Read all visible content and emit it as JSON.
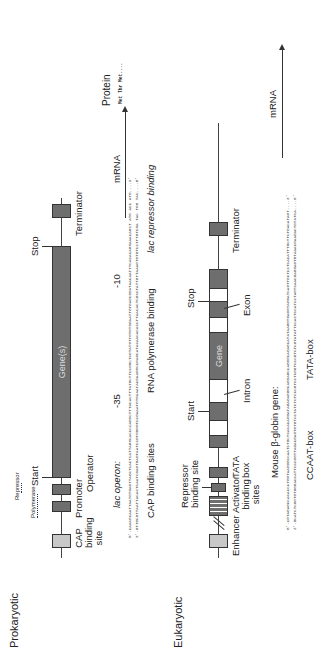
{
  "prokaryotic": {
    "title": "Prokaryotic",
    "labels": {
      "cap_binding_site": [
        "CAP",
        "binding",
        "site"
      ],
      "promoter": "Promoter",
      "operator": "Operator",
      "repressor": "Repressor",
      "polymerase": "Polymerase",
      "start": "Start",
      "gene": "Gene(s)",
      "stop": "Stop",
      "terminator": "Terminator"
    },
    "sequence": {
      "heading": "lac operon:",
      "top_strand": "5'-CAACGCAATTAATGTGAGTTAGCTCACTCATTAGGCACCCCAGGCTTTACACTTTATGCTTCCGGCTCGTATGTTGTGTGGAATTGTGAGCGGATAACAATTTCACACAGGAAACAGCT ATG ACC ATG....3'",
      "bottom_strand": "3'-GTTGCGTTAATTACACTCAATCGAGTGAGTAATCCGTGGGGTCCGAAATGTGAAATACGAAGGCCGAGCATACAACACACCTTAACACTCGCCTATTGTTAAAGTGTGTCCTTTGTCGA TAC TGG TAC....5'",
      "markers": [
        "-35",
        "-10"
      ],
      "mrna_label": "mRNA",
      "protein_label": "Protein",
      "protein_residues": "Met Thr Met....",
      "captions": [
        "CAP binding sites",
        "RNA polymerase binding",
        "lac repressor binding"
      ]
    }
  },
  "eukaryotic": {
    "title": "Eukaryotic",
    "labels": {
      "enhancer": "Enhancer",
      "activator_binding_sites": [
        "Activator",
        "binding",
        "sites"
      ],
      "repressor_binding_site": [
        "Repressor",
        "binding site"
      ],
      "tata_box": [
        "TATA",
        "box"
      ],
      "start": "Start",
      "intron": "Intron",
      "gene": "Gene",
      "stop": "Stop",
      "exon": "Exon",
      "terminator": "Terminator"
    },
    "sequence": {
      "heading": "Mouse β-globin gene:",
      "top_strand": "5'-CGTAGAGCCACACCCTGGTAAGGGCCAATCTGCTCACACAGGATAGAGAGGGCAGGAGCCAGGGCAGAGCATATAAGGTGAGGTAGGATCAGTTGCTCCTCACATTTGCTTCTGACATAGT....3'",
      "bottom_strand": "3'-GCATCTCGGTGTGGGACCATTCCCGGTTAGACGAGTGTGTCCTATCTCTCCCGTCCTCGGTCCCGTCTCGTATATTCCACTCCATCCTAGTCAACGAGGAGTGTAAACGAAGACTGTATCA....5'",
      "mrna_label": "mRNA",
      "captions": [
        "CCAAT-box",
        "TATA-box"
      ]
    }
  }
}
